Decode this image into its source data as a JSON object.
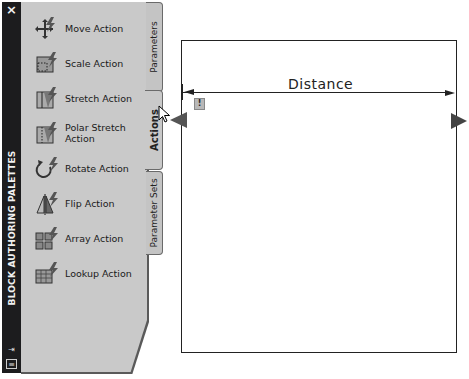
{
  "palette": {
    "title": "BLOCK AUTHORING PALETTES",
    "close_glyph": "×",
    "titlebar_icons": [
      {
        "name": "autohide-icon",
        "glyph": "⇥"
      },
      {
        "name": "properties-menu-icon",
        "glyph": "≡"
      }
    ],
    "tabs": [
      {
        "label": "Parameters",
        "active": false
      },
      {
        "label": "Actions",
        "active": true
      },
      {
        "label": "Parameter Sets",
        "active": false
      }
    ],
    "items": [
      {
        "label": "Move Action",
        "icon": "move-action-icon"
      },
      {
        "label": "Scale Action",
        "icon": "scale-action-icon"
      },
      {
        "label": "Stretch Action",
        "icon": "stretch-action-icon"
      },
      {
        "label": "Polar Stretch Action",
        "icon": "polar-stretch-action-icon"
      },
      {
        "label": "Rotate Action",
        "icon": "rotate-action-icon"
      },
      {
        "label": "Flip Action",
        "icon": "flip-action-icon"
      },
      {
        "label": "Array Action",
        "icon": "array-action-icon"
      },
      {
        "label": "Lookup Action",
        "icon": "lookup-action-icon"
      }
    ]
  },
  "drawing": {
    "dimension_label": "Distance",
    "warning_glyph": "!"
  },
  "colors": {
    "titlebar": "#1c1c1e",
    "panel": "#c9c9c9",
    "canvas": "#ffffff",
    "lines": "#222222"
  }
}
